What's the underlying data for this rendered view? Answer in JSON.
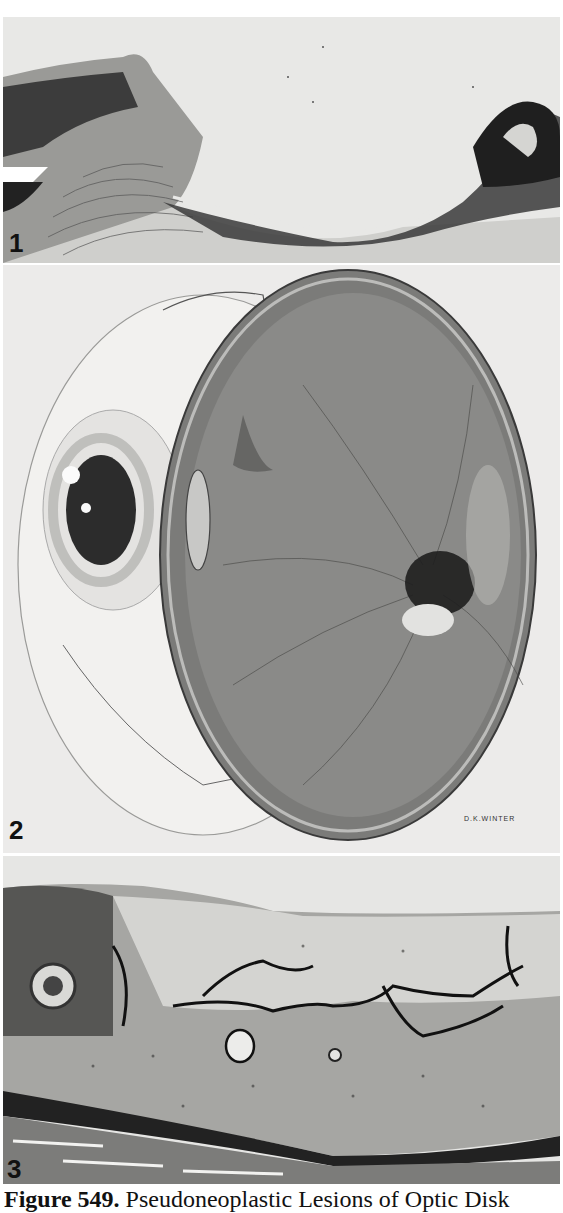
{
  "figure": {
    "number_label": "Figure 549.",
    "title": "Pseudoneoplastic Lesions of Optic Disk",
    "panels": [
      {
        "label": "1",
        "description": "Histologic section of optic disk region with cupping and adjacent retina"
      },
      {
        "label": "2",
        "description": "Drawing of bisected eyeball showing optic disk lesion",
        "signature": "D.K.WINTER"
      },
      {
        "label": "3",
        "description": "Histologic section of optic nerve head with vascular channels"
      }
    ]
  },
  "colors": {
    "background": "#ffffff",
    "tissue_light": "#e9e9e7",
    "tissue_dark": "#1a1a1a"
  }
}
